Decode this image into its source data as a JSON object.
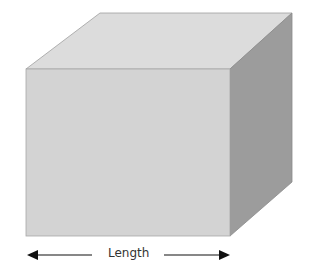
{
  "diagram": {
    "shape": "cube",
    "dimension_label": "Length",
    "colors": {
      "front": "#d3d3d3",
      "top": "#dcdcdc",
      "side": "#9c9c9c",
      "edge": "#8a8a8a",
      "arrow": "#111111"
    }
  }
}
